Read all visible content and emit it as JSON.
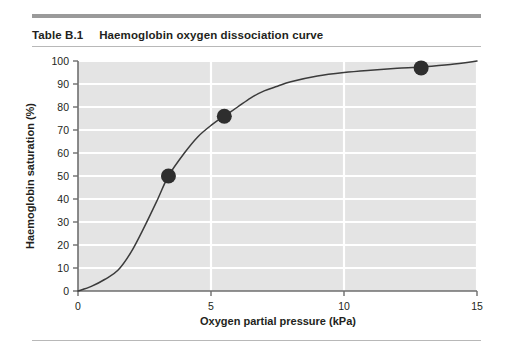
{
  "header": {
    "table_tag": "Table B.1",
    "title": "Haemoglobin oxygen dissociation curve"
  },
  "colors": {
    "plot_background": "#e4e4e4",
    "gridline": "#ffffff",
    "curve": "#3b3b3b",
    "marker": "#2e2e2e",
    "axis": "#6e6e6e",
    "text": "#231f20",
    "top_rule": "#9a9a9a",
    "hairline_rule": "#b8b8b8"
  },
  "chart_data": {
    "type": "line",
    "title": "Haemoglobin oxygen dissociation curve",
    "xlabel": "Oxygen partial pressure (kPa)",
    "ylabel": "Haemoglobin saturation (%)",
    "xlim": [
      0,
      15
    ],
    "ylim": [
      0,
      100
    ],
    "xticks": [
      0,
      5,
      10,
      15
    ],
    "xtick_labels": [
      "0",
      "5",
      "10",
      "15"
    ],
    "yticks": [
      0,
      10,
      20,
      30,
      40,
      50,
      60,
      70,
      80,
      90,
      100
    ],
    "ytick_labels": [
      "0",
      "10",
      "20",
      "30",
      "40",
      "50",
      "60",
      "70",
      "80",
      "90",
      "100"
    ],
    "grid": "horizontal-and-vertical",
    "legend": "none",
    "series": [
      {
        "name": "Haemoglobin oxygen dissociation curve",
        "x": [
          0.0,
          0.5,
          1.0,
          1.5,
          2.0,
          2.5,
          3.0,
          3.4,
          4.0,
          4.5,
          5.0,
          5.5,
          6.0,
          6.5,
          7.0,
          7.5,
          8.0,
          9.0,
          10.0,
          11.0,
          12.0,
          13.0,
          14.0,
          15.0
        ],
        "y": [
          0,
          2,
          5,
          9,
          17,
          28,
          40,
          50,
          60,
          67,
          72,
          76,
          80,
          84,
          87,
          89,
          91,
          93.5,
          95,
          96,
          96.8,
          97.5,
          98.5,
          100
        ]
      }
    ],
    "markers": [
      {
        "x": 3.4,
        "y": 50
      },
      {
        "x": 5.5,
        "y": 76
      },
      {
        "x": 12.9,
        "y": 97
      }
    ]
  }
}
